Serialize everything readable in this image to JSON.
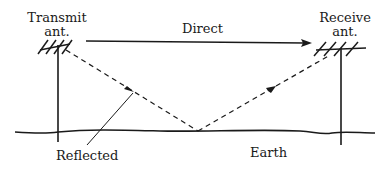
{
  "diagram": {
    "type": "two-ray ground reflection propagation",
    "labels": {
      "transmit_line1": "Transmit",
      "transmit_line2": "ant.",
      "receive_line1": "Receive",
      "receive_line2": "ant.",
      "direct": "Direct",
      "reflected": "Reflected",
      "earth": "Earth"
    },
    "colors": {
      "ink": "#1a1a1a",
      "background": "#ffffff"
    }
  }
}
